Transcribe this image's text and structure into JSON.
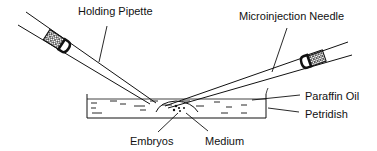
{
  "diagram": {
    "labels": {
      "holding_pipette": "Holding Pipette",
      "microinjection_needle": "Microinjection Needle",
      "paraffin_oil": "Paraffin Oil",
      "petridish": "Petridish",
      "embryos": "Embryos",
      "medium": "Medium"
    },
    "colors": {
      "stroke": "#111111",
      "background": "#ffffff"
    }
  }
}
